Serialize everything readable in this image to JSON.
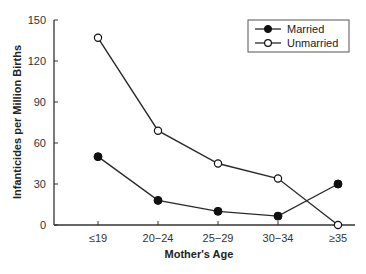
{
  "chart_data": {
    "type": "line",
    "title": "",
    "xlabel": "Mother's Age",
    "ylabel": "Infanticides per Million Births",
    "categories": [
      "≤19",
      "20−24",
      "25−29",
      "30−34",
      "≥35"
    ],
    "ylim": [
      0,
      150
    ],
    "yticks": [
      0,
      30,
      60,
      90,
      120,
      150
    ],
    "grid": false,
    "legend_position": "top-right",
    "series": [
      {
        "name": "Married",
        "marker": "filled-circle",
        "values": [
          50,
          18,
          10,
          6.5,
          30
        ]
      },
      {
        "name": "Unmarried",
        "marker": "open-circle",
        "values": [
          137,
          69,
          45,
          34,
          0
        ]
      }
    ]
  },
  "colors": {
    "line": "#2a2a2a",
    "marker_fill_open": "#ffffff",
    "axis": "#333333"
  }
}
